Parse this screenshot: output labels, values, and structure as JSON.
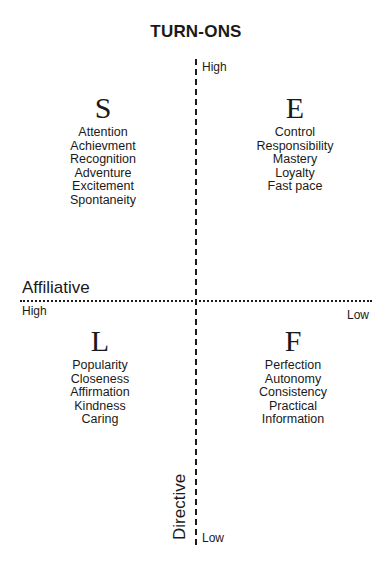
{
  "title": "TURN-ONS",
  "axes": {
    "vertical": {
      "name": "Directive",
      "high_label": "High",
      "low_label": "Low"
    },
    "horizontal": {
      "name": "Affiliative",
      "high_label": "High",
      "low_label": "Low"
    }
  },
  "quadrants": [
    {
      "letter": "S",
      "position": "top-left",
      "items": [
        "Attention",
        "Achievment",
        "Recognition",
        "Adventure",
        "Excitement",
        "Spontaneity"
      ]
    },
    {
      "letter": "E",
      "position": "top-right",
      "items": [
        "Control",
        "Responsibility",
        "Mastery",
        "Loyalty",
        "Fast pace"
      ]
    },
    {
      "letter": "L",
      "position": "bottom-left",
      "items": [
        "Popularity",
        "Closeness",
        "Affirmation",
        "Kindness",
        "Caring"
      ]
    },
    {
      "letter": "F",
      "position": "bottom-right",
      "items": [
        "Perfection",
        "Autonomy",
        "Consistency",
        "Practical",
        "Information"
      ]
    }
  ]
}
